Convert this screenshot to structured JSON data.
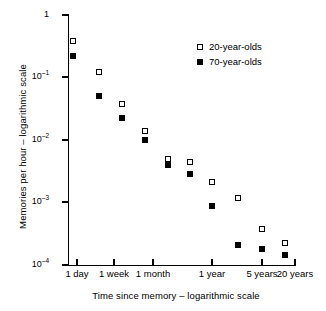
{
  "chart_data": {
    "type": "scatter",
    "title": "",
    "xlabel": "Time since memory – logarithmic scale",
    "ylabel": "Memories per hour – logarithmic scale",
    "xscale": "log",
    "yscale": "log",
    "grid": false,
    "legend_position": "top-right",
    "x_tick_labels": [
      "1 day",
      "1 week",
      "1 month",
      "1 year",
      "5 years",
      "20 years"
    ],
    "x_tick_values_days": [
      1,
      7,
      30,
      365,
      1825,
      7300
    ],
    "y_tick_labels": [
      "1",
      "10⁻¹",
      "10⁻²",
      "10⁻³",
      "10⁻⁴"
    ],
    "y_tick_values": [
      1,
      0.1,
      0.01,
      0.001,
      0.0001
    ],
    "ylim": [
      0.0001,
      1
    ],
    "series": [
      {
        "name": "20-year-olds",
        "marker": "open-square",
        "color": "#000000",
        "points": [
          {
            "x_label": "1 day",
            "y": 0.32
          },
          {
            "x_label": "1 week",
            "y": 0.105
          },
          {
            "x_label": "1 month",
            "y": 0.037
          },
          {
            "x_label": "2 months",
            "y": 0.0128
          },
          {
            "x_label": "4 months",
            "y": 0.0038
          },
          {
            "x_label": "1 year",
            "y": 0.0031
          },
          {
            "x_label": "2 years",
            "y": 0.00125
          },
          {
            "x_label": "5 years",
            "y": 0.00063
          },
          {
            "x_label": "10 years",
            "y": 0.00026
          },
          {
            "x_label": "20 years",
            "y": 0.00016
          }
        ]
      },
      {
        "name": "70-year-olds",
        "marker": "filled-square",
        "color": "#000000",
        "points": [
          {
            "x_label": "1 day",
            "y": 0.18
          },
          {
            "x_label": "1 week",
            "y": 0.045
          },
          {
            "x_label": "1 month",
            "y": 0.019
          },
          {
            "x_label": "2 months",
            "y": 0.0094
          },
          {
            "x_label": "4 months",
            "y": 0.0032
          },
          {
            "x_label": "1 year",
            "y": 0.0016
          },
          {
            "x_label": "2 years",
            "y": 0.00058
          },
          {
            "x_label": "5 years",
            "y": 0.00016
          },
          {
            "x_label": "10 years",
            "y": 0.000134
          },
          {
            "x_label": "20 years",
            "y": 0.000112
          }
        ]
      }
    ]
  },
  "axes": {
    "y_title": "Memories per hour – logarithmic scale",
    "x_title": "Time since memory – logarithmic scale",
    "y_ticks": [
      {
        "label_main": "1",
        "label_sup": "",
        "top": 15
      },
      {
        "label_main": "10",
        "label_sup": "–1",
        "top": 77
      },
      {
        "label_main": "10",
        "label_sup": "–2",
        "top": 140
      },
      {
        "label_main": "10",
        "label_sup": "–3",
        "top": 202
      },
      {
        "label_main": "10",
        "label_sup": "–4",
        "top": 265
      }
    ],
    "x_ticks": [
      {
        "label": "1 day",
        "left": 77
      },
      {
        "label": "1 week",
        "left": 114
      },
      {
        "label": "1 month",
        "left": 153
      },
      {
        "label": "1 year",
        "left": 212
      },
      {
        "label": "5 years",
        "left": 262
      },
      {
        "label": "20 years",
        "left": 295
      }
    ]
  },
  "legend": {
    "entries": [
      {
        "label": "20-year-olds",
        "style": "open"
      },
      {
        "label": "70-year-olds",
        "style": "filled"
      }
    ]
  },
  "markers": {
    "series_20": [
      {
        "left": 73,
        "top": 41
      },
      {
        "left": 99,
        "top": 72
      },
      {
        "left": 122,
        "top": 104
      },
      {
        "left": 145,
        "top": 131
      },
      {
        "left": 168,
        "top": 159
      },
      {
        "left": 190,
        "top": 162
      },
      {
        "left": 212,
        "top": 182
      },
      {
        "left": 238,
        "top": 198
      },
      {
        "left": 262,
        "top": 229
      },
      {
        "left": 285,
        "top": 243
      }
    ],
    "series_70": [
      {
        "left": 73,
        "top": 56
      },
      {
        "left": 99,
        "top": 96
      },
      {
        "left": 122,
        "top": 118
      },
      {
        "left": 145,
        "top": 140
      },
      {
        "left": 168,
        "top": 165
      },
      {
        "left": 190,
        "top": 174
      },
      {
        "left": 212,
        "top": 206
      },
      {
        "left": 238,
        "top": 245
      },
      {
        "left": 262,
        "top": 249
      },
      {
        "left": 285,
        "top": 255
      }
    ]
  }
}
